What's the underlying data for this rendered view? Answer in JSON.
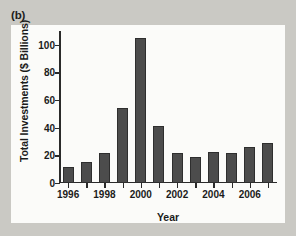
{
  "figure": {
    "panel_label": "(b)",
    "background_color": "#cac9c4",
    "plot_background_color": "#fbfbf9",
    "bar_color": "#4c4c4c",
    "axis_color": "#2a2a2a"
  },
  "chart_data": {
    "type": "bar",
    "title": "",
    "subtitle": "",
    "xlabel": "Year",
    "ylabel": "Total Investments ($ Billions)",
    "categories": [
      "1996",
      "1997",
      "1998",
      "1999",
      "2000",
      "2001",
      "2002",
      "2003",
      "2004",
      "2005",
      "2006",
      "2007"
    ],
    "values": [
      11.5,
      15,
      21.5,
      54,
      105,
      41,
      22,
      19,
      22.5,
      21.5,
      26,
      29
    ],
    "ylim": [
      0,
      110
    ],
    "yticks": [
      0,
      20,
      40,
      60,
      80,
      100
    ],
    "ytick_labels": [
      "0",
      "20",
      "40",
      "60",
      "80",
      "100"
    ],
    "xtick_labels": [
      "1996",
      "1998",
      "2000",
      "2002",
      "2004",
      "2006"
    ],
    "xtick_categories": [
      "1996",
      "1998",
      "2000",
      "2002",
      "2004",
      "2006"
    ],
    "grid": false,
    "legend": null,
    "legend_position": "none",
    "annotations": []
  }
}
